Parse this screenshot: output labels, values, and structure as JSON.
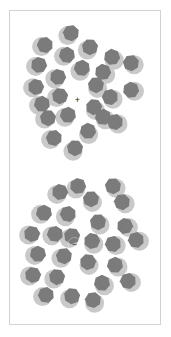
{
  "figure": {
    "background_color": "#ffffff",
    "frame": {
      "stroke_color": "#d2d2d2",
      "x": 9,
      "y": 10,
      "width": 152,
      "height": 315
    },
    "particle_style": {
      "halo_color": "#c9c9c9",
      "core_color": "#7b7b7b",
      "halo_radius": 9.5,
      "core_radius": 8.2,
      "core_sides": 7
    },
    "charge_marker_color": "#1a1a1a"
  },
  "clusters": [
    {
      "id": "cation-cluster",
      "name": "upper-cluster",
      "charge_label": "+",
      "charge_center": {
        "x": 77.5,
        "y": 99.5
      },
      "solvent_count": 24,
      "particles": [
        {
          "cx": 71.0,
          "cy": 33.0,
          "halo_dx": -3.2,
          "halo_dy": 2.6,
          "rot": 18
        },
        {
          "cx": 45.0,
          "cy": 45.0,
          "halo_dx": -3.4,
          "halo_dy": 1.6,
          "rot": 64
        },
        {
          "cx": 90.0,
          "cy": 47.0,
          "halo_dx": -2.6,
          "halo_dy": 3.0,
          "rot": 130
        },
        {
          "cx": 67.0,
          "cy": 55.0,
          "halo_dx": -3.4,
          "halo_dy": 1.2,
          "rot": 210
        },
        {
          "cx": 112.0,
          "cy": 57.0,
          "halo_dx": 2.2,
          "halo_dy": 3.2,
          "rot": 45
        },
        {
          "cx": 39.0,
          "cy": 65.0,
          "halo_dx": -3.4,
          "halo_dy": 1.4,
          "rot": 95
        },
        {
          "cx": 82.0,
          "cy": 68.0,
          "halo_dx": -2.0,
          "halo_dy": 3.2,
          "rot": 160
        },
        {
          "cx": 103.0,
          "cy": 72.0,
          "halo_dx": 2.8,
          "halo_dy": 2.6,
          "rot": 250
        },
        {
          "cx": 131.0,
          "cy": 63.0,
          "halo_dx": 3.2,
          "halo_dy": 1.8,
          "rot": 20
        },
        {
          "cx": 58.0,
          "cy": 77.0,
          "halo_dx": -3.2,
          "halo_dy": 1.8,
          "rot": 300
        },
        {
          "cx": 96.0,
          "cy": 85.0,
          "halo_dx": 1.6,
          "halo_dy": 3.4,
          "rot": 75
        },
        {
          "cx": 36.0,
          "cy": 87.0,
          "halo_dx": -3.4,
          "halo_dy": 0.8,
          "rot": 140
        },
        {
          "cx": 131.0,
          "cy": 90.0,
          "halo_dx": 3.4,
          "halo_dy": 1.2,
          "rot": 200
        },
        {
          "cx": 60.0,
          "cy": 96.0,
          "halo_dx": -3.4,
          "halo_dy": 1.6,
          "rot": 30
        },
        {
          "cx": 110.0,
          "cy": 97.0,
          "halo_dx": 3.0,
          "halo_dy": 2.2,
          "rot": 115
        },
        {
          "cx": 42.0,
          "cy": 104.0,
          "halo_dx": -3.4,
          "halo_dy": 1.4,
          "rot": 260
        },
        {
          "cx": 94.0,
          "cy": 107.0,
          "halo_dx": 1.4,
          "halo_dy": 3.4,
          "rot": 340
        },
        {
          "cx": 68.0,
          "cy": 115.0,
          "halo_dx": -3.0,
          "halo_dy": 2.2,
          "rot": 55
        },
        {
          "cx": 48.0,
          "cy": 118.0,
          "halo_dx": -3.4,
          "halo_dy": 1.0,
          "rot": 180
        },
        {
          "cx": 115.0,
          "cy": 122.0,
          "halo_dx": 3.0,
          "halo_dy": 2.0,
          "rot": 220
        },
        {
          "cx": 88.0,
          "cy": 131.0,
          "halo_dx": 0.6,
          "halo_dy": 3.5,
          "rot": 100
        },
        {
          "cx": 54.0,
          "cy": 138.0,
          "halo_dx": -3.4,
          "halo_dy": 1.6,
          "rot": 15
        },
        {
          "cx": 75.0,
          "cy": 148.0,
          "halo_dx": -2.0,
          "halo_dy": 3.2,
          "rot": 285
        },
        {
          "cx": 103.0,
          "cy": 117.0,
          "halo_dx": 2.4,
          "halo_dy": 2.8,
          "rot": 160
        }
      ]
    },
    {
      "id": "anion-cluster",
      "name": "lower-cluster",
      "charge_label": "−",
      "charge_center": {
        "x": 74.5,
        "y": 244.0
      },
      "solvent_count": 26,
      "particles": [
        {
          "cx": 60.0,
          "cy": 192.0,
          "halo_dx": -3.2,
          "halo_dy": 2.4,
          "rot": 40
        },
        {
          "cx": 113.0,
          "cy": 186.0,
          "halo_dx": 3.0,
          "halo_dy": 2.2,
          "rot": 125
        },
        {
          "cx": 91.0,
          "cy": 199.0,
          "halo_dx": 1.4,
          "halo_dy": 3.4,
          "rot": 230
        },
        {
          "cx": 122.0,
          "cy": 202.0,
          "halo_dx": 3.2,
          "halo_dy": 1.8,
          "rot": 70
        },
        {
          "cx": 44.0,
          "cy": 213.0,
          "halo_dx": -3.4,
          "halo_dy": 1.2,
          "rot": 310
        },
        {
          "cx": 68.0,
          "cy": 214.0,
          "halo_dx": -2.6,
          "halo_dy": 2.8,
          "rot": 165
        },
        {
          "cx": 98.0,
          "cy": 222.0,
          "halo_dx": 2.0,
          "halo_dy": 3.0,
          "rot": 25
        },
        {
          "cx": 125.0,
          "cy": 226.0,
          "halo_dx": 3.4,
          "halo_dy": 1.4,
          "rot": 195
        },
        {
          "cx": 32.0,
          "cy": 234.0,
          "halo_dx": -3.4,
          "halo_dy": 1.0,
          "rot": 85
        },
        {
          "cx": 55.0,
          "cy": 234.0,
          "halo_dx": -3.2,
          "halo_dy": 1.8,
          "rot": 265
        },
        {
          "cx": 92.0,
          "cy": 241.0,
          "halo_dx": 1.8,
          "halo_dy": 3.2,
          "rot": 140
        },
        {
          "cx": 113.0,
          "cy": 244.0,
          "halo_dx": 3.2,
          "halo_dy": 1.6,
          "rot": 10
        },
        {
          "cx": 136.0,
          "cy": 240.0,
          "halo_dx": 3.4,
          "halo_dy": 1.2,
          "rot": 215
        },
        {
          "cx": 38.0,
          "cy": 254.0,
          "halo_dx": -3.4,
          "halo_dy": 1.4,
          "rot": 50
        },
        {
          "cx": 64.0,
          "cy": 256.0,
          "halo_dx": -3.0,
          "halo_dy": 2.2,
          "rot": 175
        },
        {
          "cx": 88.0,
          "cy": 262.0,
          "halo_dx": 1.0,
          "halo_dy": 3.4,
          "rot": 290
        },
        {
          "cx": 115.0,
          "cy": 265.0,
          "halo_dx": 3.0,
          "halo_dy": 2.0,
          "rot": 105
        },
        {
          "cx": 33.0,
          "cy": 275.0,
          "halo_dx": -3.4,
          "halo_dy": 1.0,
          "rot": 240
        },
        {
          "cx": 57.0,
          "cy": 277.0,
          "halo_dx": -3.2,
          "halo_dy": 2.0,
          "rot": 30
        },
        {
          "cx": 102.0,
          "cy": 283.0,
          "halo_dx": 2.4,
          "halo_dy": 2.8,
          "rot": 155
        },
        {
          "cx": 128.0,
          "cy": 281.0,
          "halo_dx": 3.4,
          "halo_dy": 1.4,
          "rot": 320
        },
        {
          "cx": 46.0,
          "cy": 295.0,
          "halo_dx": -3.4,
          "halo_dy": 1.6,
          "rot": 60
        },
        {
          "cx": 72.0,
          "cy": 296.0,
          "halo_dx": -2.4,
          "halo_dy": 2.8,
          "rot": 185
        },
        {
          "cx": 93.0,
          "cy": 300.0,
          "halo_dx": 1.6,
          "halo_dy": 3.2,
          "rot": 275
        },
        {
          "cx": 72.0,
          "cy": 236.0,
          "halo_dx": -2.8,
          "halo_dy": 2.6,
          "rot": 135
        },
        {
          "cx": 78.0,
          "cy": 186.0,
          "halo_dx": -2.2,
          "halo_dy": 3.0,
          "rot": 95
        }
      ]
    }
  ]
}
